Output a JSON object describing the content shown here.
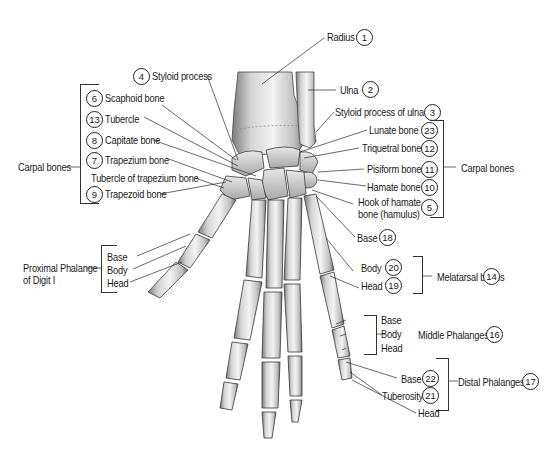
{
  "figure": {
    "colors": {
      "bone_light": "#f2f2f2",
      "bone_mid": "#c9c9c9",
      "bone_dark": "#6e6e6e",
      "line": "#333333",
      "background": "#ffffff"
    }
  },
  "labels": {
    "radius": {
      "text": "Radius",
      "num": "1"
    },
    "ulna": {
      "text": "Ulna",
      "num": "2"
    },
    "styloid_ulna": {
      "text": "Styloid process of ulna",
      "num": "3"
    },
    "styloid_process": {
      "text": "Styloid process",
      "num": "4"
    },
    "scaphoid": {
      "text": "Scaphoid bone",
      "num": "6"
    },
    "tubercle": {
      "text": "Tubercle",
      "num": "13"
    },
    "capitate": {
      "text": "Capitate bone",
      "num": "8"
    },
    "trapezium": {
      "text": "Trapezium bone",
      "num": "7"
    },
    "tubercle_trapezium": {
      "text": "Tubercle of trapezium bone"
    },
    "trapezoid": {
      "text": "Trapezoid bone",
      "num": "9"
    },
    "carpal_left": {
      "text": "Carpal bones"
    },
    "lunate": {
      "text": "Lunate bone",
      "num": "23"
    },
    "triquetral": {
      "text": "Triquetral bone",
      "num": "12"
    },
    "pisiform": {
      "text": "Pisiform bone",
      "num": "11"
    },
    "hamate": {
      "text": "Hamate bone",
      "num": "10"
    },
    "hook_hamate": {
      "line1": "Hook of hamate",
      "line2": "bone (hamulus)",
      "num": "5"
    },
    "carpal_right": {
      "text": "Carpal bones"
    },
    "meta_base": {
      "text": "Base",
      "num": "18"
    },
    "meta_body": {
      "text": "Body",
      "num": "20"
    },
    "meta_head": {
      "text": "Head",
      "num": "19"
    },
    "metatarsal": {
      "text": "Melatarsal bones",
      "num": "14"
    },
    "prox_phalange": {
      "line1": "Proximal Phalange",
      "line2": "of Digit I"
    },
    "prox_base": {
      "text": "Base"
    },
    "prox_body": {
      "text": "Body"
    },
    "prox_head": {
      "text": "Head"
    },
    "mid_base": {
      "text": "Base"
    },
    "mid_body": {
      "text": "Body"
    },
    "mid_head": {
      "text": "Head"
    },
    "middle_phalanges": {
      "text": "Middle Phalanges",
      "num": "16"
    },
    "dist_base": {
      "text": "Base",
      "num": "22"
    },
    "dist_tuberosity": {
      "text": "Tuberosity",
      "num": "21"
    },
    "dist_head": {
      "text": "Head"
    },
    "distal_phalanges": {
      "text": "Distal Phalanges",
      "num": "17"
    }
  }
}
